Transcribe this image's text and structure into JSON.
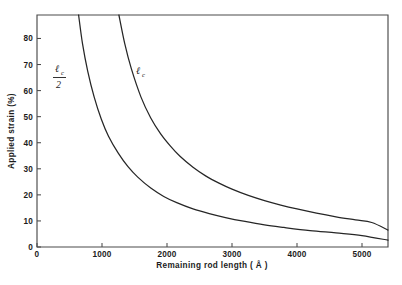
{
  "figure": {
    "background_color": "#ffffff",
    "frame_color": "#4a4a4a",
    "curve_color": "#262626"
  },
  "chart_data": {
    "type": "line",
    "title": "",
    "xlabel": "Remaining rod length ( Å )",
    "ylabel": "Applied strain (%)",
    "xlim": [
      0,
      5400
    ],
    "ylim": [
      0,
      89
    ],
    "grid": false,
    "legend_position": "inline-annotation",
    "xticks": [
      0,
      1000,
      2000,
      3000,
      4000,
      5000
    ],
    "xtick_labels": [
      "0",
      "1000",
      "2000",
      "3000",
      "4000",
      "5000"
    ],
    "yticks": [
      0,
      10,
      20,
      30,
      40,
      50,
      60,
      70,
      80
    ],
    "ytick_labels": [
      "0",
      "10",
      "20",
      "30",
      "40",
      "50",
      "60",
      "70",
      "80"
    ],
    "annotations": [
      {
        "name": "lc-over-2",
        "text": "ℓc/2",
        "numerator": "ℓ",
        "numerator_sub": "c",
        "denominator": "2",
        "x": 780,
        "y": 70
      },
      {
        "name": "lc",
        "text": "ℓc",
        "symbol": "ℓ",
        "symbol_sub": "c",
        "x": 1430,
        "y": 71
      }
    ],
    "series": [
      {
        "name": "ℓc",
        "description": "Upper curve — critical rod length",
        "x": [
          1260,
          1350,
          1450,
          1600,
          1750,
          1900,
          2050,
          2200,
          2400,
          2600,
          2800,
          3000,
          3250,
          3500,
          3750,
          4000,
          4300,
          4600,
          4900,
          5150,
          5400
        ],
        "values": [
          89.0,
          78.0,
          68.5,
          57.5,
          49.5,
          43.5,
          38.8,
          34.8,
          30.6,
          27.2,
          24.5,
          22.2,
          19.8,
          17.8,
          16.1,
          14.6,
          13.0,
          11.6,
          10.4,
          9.4,
          6.5
        ]
      },
      {
        "name": "ℓc/2",
        "description": "Lower curve — half critical rod length",
        "x": [
          640,
          700,
          780,
          880,
          990,
          1100,
          1250,
          1400,
          1550,
          1750,
          1950,
          2150,
          2400,
          2650,
          2900,
          3200,
          3500,
          3800,
          4200,
          4600,
          5000,
          5400
        ],
        "values": [
          89.0,
          78.0,
          67.5,
          57.5,
          49.0,
          42.5,
          36.0,
          30.8,
          26.8,
          22.6,
          19.4,
          17.0,
          14.6,
          12.8,
          11.3,
          9.8,
          8.5,
          7.5,
          6.3,
          5.4,
          4.4,
          2.6
        ]
      }
    ]
  },
  "axes": {
    "x_title": "Remaining rod length ( Å )",
    "y_title": "Applied strain (%)"
  }
}
